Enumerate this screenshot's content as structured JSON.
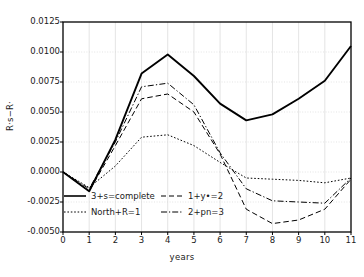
{
  "chart_data": {
    "type": "line",
    "title": "",
    "xlabel": "years",
    "ylabel": "R·s−R·",
    "x": [
      0,
      1,
      2,
      3,
      4,
      5,
      6,
      7,
      8,
      9,
      10,
      11
    ],
    "xlim": [
      0,
      11
    ],
    "ylim": [
      -0.005,
      0.0125
    ],
    "xticks": [
      "0",
      "1",
      "2",
      "3",
      "4",
      "5",
      "6",
      "7",
      "8",
      "9",
      "10",
      "11"
    ],
    "yticks": [
      "0.0125",
      "0.0100",
      "0.0075",
      "0.0050",
      "0.0025",
      "0.0000",
      "-0.0025",
      "-0.0050"
    ],
    "ytick_values": [
      0.0125,
      0.01,
      0.0075,
      0.005,
      0.0025,
      0.0,
      -0.0025,
      -0.005
    ],
    "grid": true,
    "legend_position": "lower-left-inside",
    "series": [
      {
        "name": "3+s=complete",
        "style": "solid",
        "color": "#000000",
        "values": [
          0.0,
          -0.0016,
          0.0027,
          0.0082,
          0.0098,
          0.008,
          0.0057,
          0.0043,
          0.0048,
          0.0061,
          0.0076,
          0.0105
        ]
      },
      {
        "name": "North+R=1",
        "style": "dotted",
        "color": "#000000",
        "values": [
          0.0,
          -0.0013,
          0.0005,
          0.0029,
          0.0031,
          0.0022,
          0.0008,
          -0.0005,
          -0.0006,
          -0.0007,
          -0.0009,
          -0.0005
        ]
      },
      {
        "name": "1+y•=2",
        "style": "dashed",
        "color": "#000000",
        "values": [
          0.0,
          -0.0016,
          0.0022,
          0.0061,
          0.0065,
          0.005,
          0.0015,
          -0.0031,
          -0.0043,
          -0.004,
          -0.0031,
          -0.0006
        ]
      },
      {
        "name": "2+pn=3",
        "style": "dashdot",
        "color": "#000000",
        "values": [
          0.0,
          -0.0014,
          0.0025,
          0.0071,
          0.0074,
          0.0056,
          0.0016,
          -0.0014,
          -0.0024,
          -0.0025,
          -0.0026,
          -0.0005
        ]
      }
    ]
  },
  "axes": {
    "xlabel": "years",
    "ylabel": "R·s−R·"
  },
  "legend": {
    "items": [
      {
        "label": "3+s=complete",
        "style": "solid"
      },
      {
        "label": "1+y•=2",
        "style": "dashed"
      },
      {
        "label": "North+R=1",
        "style": "dotted"
      },
      {
        "label": "2+pn=3",
        "style": "dashdot"
      }
    ]
  },
  "colors": {
    "line": "#000000",
    "grid": "#d8d8d8",
    "frame": "#000000",
    "background": "#ffffff",
    "text": "#1a1a1a"
  }
}
